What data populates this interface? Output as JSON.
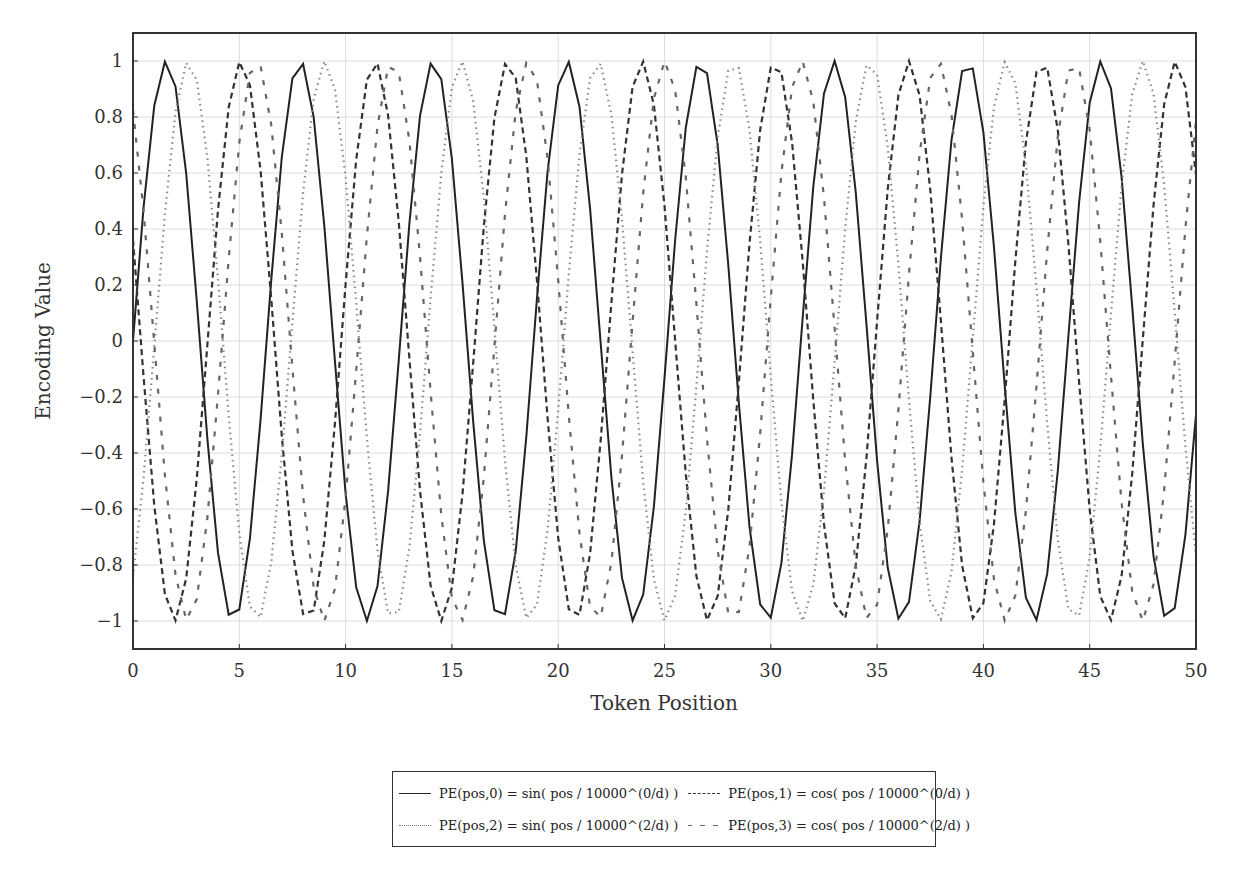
{
  "chart_data": {
    "type": "line",
    "title": "",
    "xlabel": "Token Position",
    "ylabel": "Encoding Value",
    "xlim": [
      0,
      50
    ],
    "ylim": [
      -1.1,
      1.1
    ],
    "xticks": [
      0,
      5,
      10,
      15,
      20,
      25,
      30,
      35,
      40,
      45,
      50
    ],
    "yticks": [
      -1,
      -0.8,
      -0.6,
      -0.4,
      -0.2,
      0,
      0.2,
      0.4,
      0.6,
      0.8,
      1
    ],
    "grid": true,
    "legend_position": "below",
    "sample_step": 0.5,
    "series": [
      {
        "name": "PE(pos,0) = sin(pos / 10000^(0/d))",
        "func": "sin",
        "freq": 1.0,
        "phase": 0.0,
        "style": "solid",
        "color": "#222222"
      },
      {
        "name": "PE(pos,1) = cos(pos / 10000^(0/d))",
        "func": "cos",
        "freq": 1.0,
        "phase": 1.2,
        "style": "dashed",
        "color": "#333333"
      },
      {
        "name": "PE(pos,2) = sin(pos / 10000^(2/d))",
        "func": "sin",
        "freq": 0.98,
        "phase": -1.0,
        "style": "dotted",
        "color": "#888888"
      },
      {
        "name": "PE(pos,3) = cos(pos / 10000^(2/d))",
        "func": "cos",
        "freq": 0.98,
        "phase": 0.6,
        "style": "loose-dashed",
        "color": "#666666"
      }
    ]
  },
  "legend": {
    "items": [
      {
        "label": "PE(pos,0) = sin( pos / 10000^(0/d) )"
      },
      {
        "label": "PE(pos,1) = cos( pos / 10000^(0/d) )"
      },
      {
        "label": "PE(pos,2) = sin( pos / 10000^(2/d) )"
      },
      {
        "label": "PE(pos,3) = cos( pos / 10000^(2/d) )"
      }
    ]
  }
}
